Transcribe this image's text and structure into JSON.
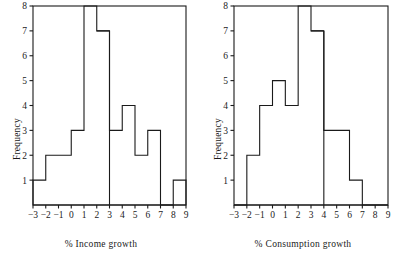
{
  "figure": {
    "background": "#ffffff",
    "ink_color": "#1a1a1a",
    "panels": [
      {
        "id": "income",
        "ylabel": "Frequency",
        "xlabel": "% Income growth"
      },
      {
        "id": "consumption",
        "ylabel": "Frequency",
        "xlabel": "% Consumption growth"
      }
    ]
  },
  "chart_data": [
    {
      "type": "bar",
      "subtype": "histogram",
      "id": "income-histogram",
      "title": "",
      "xlabel": "% Income growth",
      "ylabel": "Frequency",
      "xlim": [
        -3,
        9
      ],
      "ylim": [
        0,
        8
      ],
      "xticks": [
        -3,
        -2,
        -1,
        0,
        1,
        2,
        3,
        4,
        5,
        6,
        7,
        8,
        9
      ],
      "xtick_labels": [
        "-3",
        "-2",
        "-1",
        "0",
        "1",
        "2",
        "3",
        "4",
        "5",
        "6",
        "7",
        "8",
        "9"
      ],
      "yticks": [
        1,
        2,
        3,
        4,
        5,
        6,
        7,
        8
      ],
      "ytick_labels": [
        "1",
        "2",
        "3",
        "4",
        "5",
        "6",
        "7",
        "8"
      ],
      "grid": false,
      "legend": "none",
      "bin_edges": [
        -3,
        -2,
        -1,
        0,
        1,
        2,
        3,
        4,
        5,
        6,
        7,
        8,
        9
      ],
      "bin_labels": [
        "-3 to -2",
        "-2 to -1",
        "-1 to 0",
        "0 to 1",
        "1 to 2",
        "2 to 3",
        "3 to 4",
        "4 to 5",
        "5 to 6",
        "6 to 7",
        "7 to 8",
        "8 to 9"
      ],
      "categories": [
        "-3",
        "-2",
        "-1",
        "0",
        "1",
        "2",
        "3",
        "4",
        "5",
        "6",
        "7",
        "8"
      ],
      "values": [
        1,
        2,
        2,
        3,
        8,
        7,
        3,
        4,
        2,
        3,
        0,
        1
      ],
      "clipped_bins": [
        "1 to 2",
        "2 to 3"
      ],
      "notes": "Bars over the 1-to-2 and 2-to-3 bins extend above the plotted y-axis maximum of 8; the 2-to-3 bar shows a visible step at 7."
    },
    {
      "type": "bar",
      "subtype": "histogram",
      "id": "consumption-histogram",
      "title": "",
      "xlabel": "% Consumption growth",
      "ylabel": "Frequency",
      "xlim": [
        -3,
        9
      ],
      "ylim": [
        0,
        8
      ],
      "xticks": [
        -3,
        -2,
        -1,
        0,
        1,
        2,
        3,
        4,
        5,
        6,
        7,
        8,
        9
      ],
      "xtick_labels": [
        "-3",
        "-2",
        "-1",
        "0",
        "1",
        "2",
        "3",
        "4",
        "5",
        "6",
        "7",
        "8",
        "9"
      ],
      "yticks": [
        1,
        2,
        3,
        4,
        5,
        6,
        7,
        8
      ],
      "ytick_labels": [
        "1",
        "2",
        "3",
        "4",
        "5",
        "6",
        "7",
        "8"
      ],
      "grid": false,
      "legend": "none",
      "bin_edges": [
        -3,
        -2,
        -1,
        0,
        1,
        2,
        3,
        4,
        5,
        6,
        7,
        8,
        9
      ],
      "bin_labels": [
        "-3 to -2",
        "-2 to -1",
        "-1 to 0",
        "0 to 1",
        "1 to 2",
        "2 to 3",
        "3 to 4",
        "4 to 5",
        "5 to 6",
        "6 to 7",
        "7 to 8",
        "8 to 9"
      ],
      "categories": [
        "-3",
        "-2",
        "-1",
        "0",
        "1",
        "2",
        "3",
        "4",
        "5",
        "6",
        "7",
        "8"
      ],
      "values": [
        0,
        2,
        4,
        5,
        4,
        8,
        7,
        3,
        3,
        1,
        0,
        0
      ],
      "clipped_bins": [
        "2 to 3",
        "3 to 4"
      ],
      "notes": "Bars over the 2-to-3 and 3-to-4 bins extend above the plotted y-axis maximum of 8; the 3-to-4 bar shows a visible step at 7."
    }
  ],
  "caption": {
    "text": ""
  }
}
